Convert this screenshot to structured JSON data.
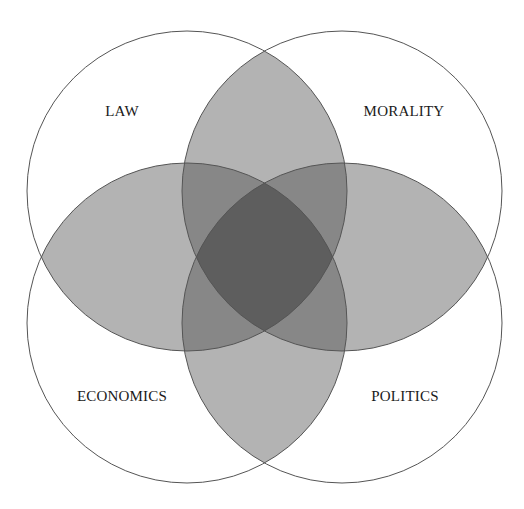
{
  "diagram": {
    "type": "venn-4-circles",
    "radius": 160,
    "circles": [
      {
        "id": "law",
        "label": "LAW",
        "cx": 187,
        "cy": 191,
        "label_x": 122,
        "label_y": 111
      },
      {
        "id": "morality",
        "label": "MORALITY",
        "cx": 342,
        "cy": 191,
        "label_x": 404,
        "label_y": 111
      },
      {
        "id": "economics",
        "label": "ECONOMICS",
        "cx": 187,
        "cy": 323,
        "label_x": 122,
        "label_y": 396
      },
      {
        "id": "politics",
        "label": "POLITICS",
        "cx": 342,
        "cy": 323,
        "label_x": 405,
        "label_y": 396
      }
    ],
    "shaded_intersections": [
      [
        "law",
        "morality"
      ],
      [
        "economics",
        "politics"
      ],
      [
        "law",
        "economics"
      ],
      [
        "morality",
        "politics"
      ]
    ],
    "colors": {
      "outline": "#555555",
      "overlap_fill": "#4a4a4a",
      "overlap_opacity": 0.42,
      "background": "#ffffff"
    }
  }
}
